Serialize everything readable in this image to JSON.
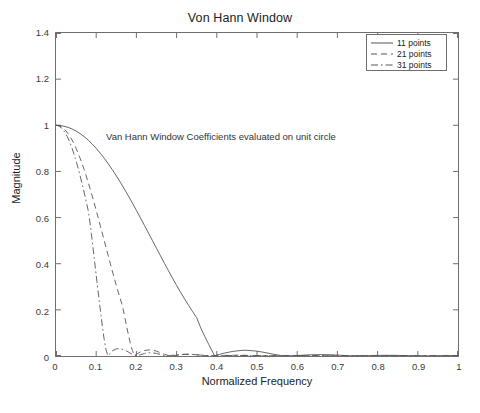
{
  "chart_data": {
    "type": "line",
    "title": "Von Hann Window",
    "xlabel": "Normalized Frequency",
    "ylabel": "Magnitude",
    "xlim": [
      0,
      1
    ],
    "ylim": [
      0,
      1.4
    ],
    "grid": false,
    "box": true,
    "legend_position": "upper right",
    "xticks": [
      "0",
      "0.1",
      "0.2",
      "0.3",
      "0.4",
      "0.5",
      "0.6",
      "0.7",
      "0.8",
      "0.9",
      "1"
    ],
    "xtick_values": [
      0,
      0.1,
      0.2,
      0.3,
      0.4,
      0.5,
      0.6,
      0.7,
      0.8,
      0.9,
      1
    ],
    "yticks": [
      "0",
      "0.2",
      "0.4",
      "0.6",
      "0.8",
      "1",
      "1.2",
      "1.4"
    ],
    "ytick_values": [
      0,
      0.2,
      0.4,
      0.6,
      0.8,
      1.0,
      1.2,
      1.4
    ],
    "annotations": [
      {
        "text": "Van Hann Window Coefficients evaluated on unit circle",
        "x": 0.127,
        "y": 1.02
      }
    ],
    "series": [
      {
        "name": "11 points",
        "linestyle": "solid",
        "color": "#555555",
        "x": [
          0,
          0.01,
          0.02,
          0.03,
          0.04,
          0.05,
          0.06,
          0.07,
          0.08,
          0.09,
          0.1,
          0.11,
          0.12,
          0.13,
          0.14,
          0.15,
          0.16,
          0.17,
          0.18,
          0.19,
          0.2,
          0.21,
          0.22,
          0.23,
          0.24,
          0.25,
          0.26,
          0.27,
          0.28,
          0.29,
          0.3,
          0.31,
          0.32,
          0.33,
          0.34,
          0.35,
          0.36,
          0.37,
          0.38,
          0.39,
          0.395,
          0.4,
          0.42,
          0.44,
          0.46,
          0.47,
          0.48,
          0.5,
          0.52,
          0.54,
          0.56,
          0.575,
          0.59,
          0.61,
          0.63,
          0.65,
          0.66,
          0.68,
          0.7,
          0.72,
          0.74,
          0.75,
          0.77,
          0.79,
          0.81,
          0.83,
          0.85,
          0.86,
          0.88,
          0.9,
          0.92,
          0.94,
          0.95,
          0.97,
          0.99,
          1
        ],
        "y": [
          1,
          0.999,
          0.996,
          0.991,
          0.984,
          0.975,
          0.964,
          0.951,
          0.936,
          0.919,
          0.9,
          0.879,
          0.857,
          0.833,
          0.808,
          0.781,
          0.753,
          0.724,
          0.694,
          0.663,
          0.631,
          0.599,
          0.566,
          0.533,
          0.5,
          0.467,
          0.434,
          0.401,
          0.369,
          0.337,
          0.306,
          0.276,
          0.247,
          0.219,
          0.192,
          0.166,
          0.122,
          0.085,
          0.05,
          0.016,
          0,
          0.004,
          0.013,
          0.02,
          0.024,
          0.025,
          0.024,
          0.021,
          0.015,
          0.008,
          0.002,
          0,
          0.001,
          0.003,
          0.005,
          0.006,
          0.0062,
          0.0055,
          0.004,
          0.002,
          0.0005,
          0,
          0.001,
          0.002,
          0.0028,
          0.003,
          0.0026,
          0.0022,
          0.0012,
          0.0003,
          0,
          0.0006,
          0.0011,
          0.0016,
          0.0012,
          0.001
        ]
      },
      {
        "name": "21 points",
        "linestyle": "dashed",
        "color": "#555555",
        "x": [
          0,
          0.005,
          0.01,
          0.015,
          0.02,
          0.025,
          0.03,
          0.035,
          0.04,
          0.045,
          0.05,
          0.055,
          0.06,
          0.065,
          0.07,
          0.075,
          0.08,
          0.085,
          0.09,
          0.095,
          0.1,
          0.105,
          0.11,
          0.115,
          0.12,
          0.125,
          0.13,
          0.135,
          0.14,
          0.145,
          0.15,
          0.155,
          0.16,
          0.165,
          0.17,
          0.175,
          0.18,
          0.185,
          0.19,
          0.195,
          0.2,
          0.21,
          0.22,
          0.23,
          0.235,
          0.24,
          0.25,
          0.26,
          0.27,
          0.28,
          0.29,
          0.3,
          0.31,
          0.32,
          0.33,
          0.34,
          0.35,
          0.37,
          0.39,
          0.41,
          0.43,
          0.45,
          0.47,
          0.5,
          0.55,
          0.6,
          0.65,
          0.7,
          0.75,
          0.8,
          0.85,
          0.9,
          0.95,
          1
        ],
        "y": [
          1,
          0.999,
          0.996,
          0.991,
          0.984,
          0.975,
          0.964,
          0.951,
          0.936,
          0.919,
          0.9,
          0.879,
          0.857,
          0.833,
          0.808,
          0.781,
          0.753,
          0.724,
          0.694,
          0.663,
          0.631,
          0.599,
          0.566,
          0.533,
          0.5,
          0.467,
          0.434,
          0.401,
          0.369,
          0.337,
          0.306,
          0.276,
          0.247,
          0.219,
          0.179,
          0.134,
          0.093,
          0.055,
          0.024,
          0.002,
          0.007,
          0.018,
          0.024,
          0.026,
          0.0265,
          0.026,
          0.021,
          0.014,
          0.007,
          0.002,
          0.0005,
          0.003,
          0.006,
          0.0075,
          0.0078,
          0.007,
          0.005,
          0.002,
          0.0008,
          0.002,
          0.003,
          0.0035,
          0.003,
          0.0015,
          0.001,
          0.0015,
          0.0012,
          0.0008,
          0.001,
          0.0012,
          0.0008,
          0.0006,
          0.0008,
          0.0006
        ]
      },
      {
        "name": "31 points",
        "linestyle": "dashdot",
        "color": "#555555",
        "x": [
          0,
          0.004,
          0.008,
          0.012,
          0.016,
          0.02,
          0.024,
          0.028,
          0.032,
          0.036,
          0.04,
          0.044,
          0.048,
          0.052,
          0.056,
          0.06,
          0.064,
          0.068,
          0.072,
          0.076,
          0.08,
          0.084,
          0.088,
          0.092,
          0.096,
          0.1,
          0.104,
          0.108,
          0.112,
          0.116,
          0.12,
          0.124,
          0.128,
          0.13,
          0.135,
          0.14,
          0.15,
          0.16,
          0.17,
          0.175,
          0.18,
          0.19,
          0.2,
          0.21,
          0.22,
          0.23,
          0.24,
          0.25,
          0.26,
          0.27,
          0.28,
          0.3,
          0.32,
          0.34,
          0.36,
          0.38,
          0.4,
          0.45,
          0.5,
          0.55,
          0.6,
          0.65,
          0.7,
          0.75,
          0.8,
          0.85,
          0.9,
          0.95,
          1
        ],
        "y": [
          1,
          0.999,
          0.996,
          0.991,
          0.984,
          0.975,
          0.964,
          0.951,
          0.936,
          0.919,
          0.9,
          0.879,
          0.857,
          0.833,
          0.808,
          0.781,
          0.753,
          0.724,
          0.694,
          0.663,
          0.631,
          0.585,
          0.53,
          0.47,
          0.41,
          0.35,
          0.29,
          0.232,
          0.175,
          0.12,
          0.07,
          0.03,
          0.006,
          0.001,
          0.012,
          0.022,
          0.031,
          0.032,
          0.027,
          0.022,
          0.017,
          0.007,
          0.001,
          0.005,
          0.011,
          0.014,
          0.0135,
          0.011,
          0.006,
          0.002,
          0.001,
          0.005,
          0.007,
          0.0065,
          0.004,
          0.0015,
          0.001,
          0.0025,
          0.0018,
          0.001,
          0.0018,
          0.0012,
          0.0008,
          0.0014,
          0.001,
          0.0007,
          0.0012,
          0.0008,
          0.0006
        ]
      }
    ]
  },
  "legend": {
    "items": [
      {
        "label": "11 points",
        "style": "solid"
      },
      {
        "label": "21 points",
        "style": "dashed"
      },
      {
        "label": "31 points",
        "style": "dashdot"
      }
    ]
  }
}
